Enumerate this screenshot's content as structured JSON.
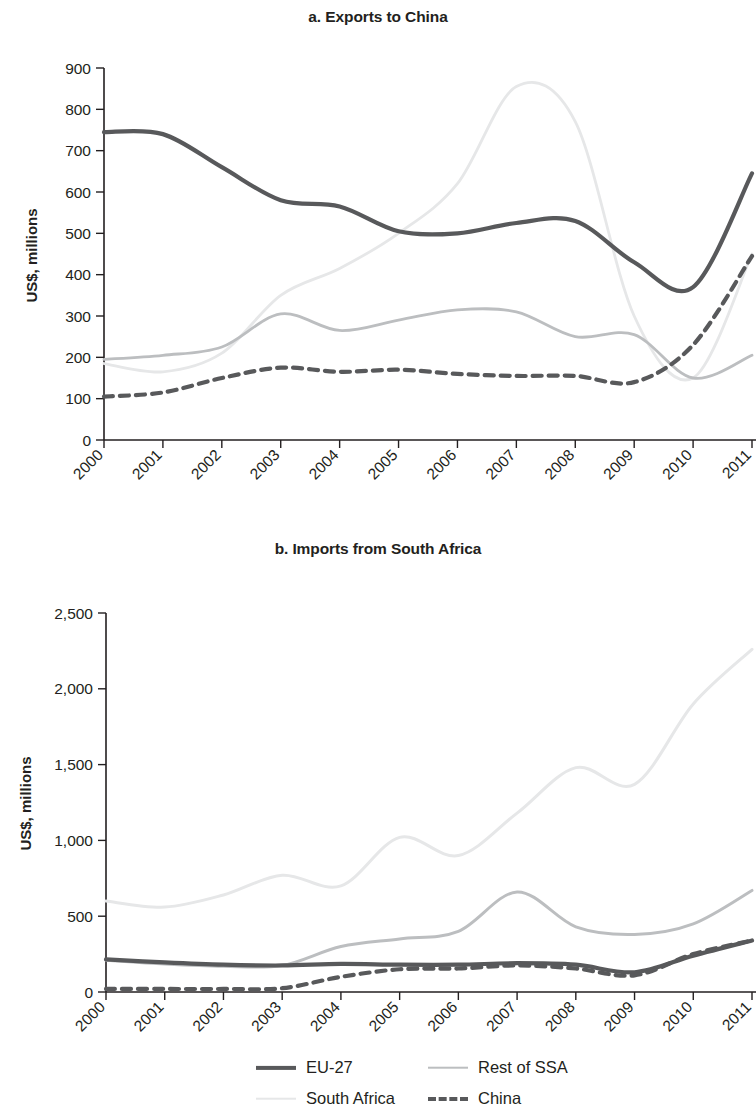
{
  "figure": {
    "panel_a_title": "a. Exports to China",
    "panel_b_title": "b. Imports from South Africa",
    "y_axis_title": "US$, millions"
  },
  "legend": {
    "position": "bottom",
    "items": [
      {
        "label": "EU-27",
        "color": "#58595b",
        "style": "solid",
        "width": 4.2,
        "swatch": "line-swatch-eu27"
      },
      {
        "label": "Rest of SSA",
        "color": "#bcbec0",
        "style": "solid",
        "width": 2.6,
        "swatch": "line-swatch-rest-of-ssa"
      },
      {
        "label": "South Africa",
        "color": "#e6e7e8",
        "style": "solid",
        "width": 2.6,
        "swatch": "line-swatch-south-africa"
      },
      {
        "label": "China",
        "color": "#58595b",
        "style": "dashed",
        "width": 4.2,
        "swatch": "line-swatch-china"
      }
    ]
  },
  "chart_data": [
    {
      "id": "panel-a",
      "type": "line",
      "title": "a. Exports to China",
      "xlabel": "",
      "ylabel": "US$, millions",
      "x": [
        2000,
        2001,
        2002,
        2003,
        2004,
        2005,
        2006,
        2007,
        2008,
        2009,
        2010,
        2011
      ],
      "xtick_labels": [
        "2000",
        "2001",
        "2002",
        "2003",
        "2004",
        "2005",
        "2006",
        "2007",
        "2008",
        "2009",
        "2010",
        "2011"
      ],
      "ytick_values": [
        0,
        100,
        200,
        300,
        400,
        500,
        600,
        700,
        800,
        900
      ],
      "ytick_labels": [
        "0",
        "100",
        "200",
        "300",
        "400",
        "500",
        "600",
        "700",
        "800",
        "900"
      ],
      "ylim": [
        0,
        900
      ],
      "grid": false,
      "series": [
        {
          "name": "EU-27",
          "color": "#58595b",
          "style": "solid",
          "width": 4.2,
          "values": [
            745,
            740,
            660,
            580,
            565,
            505,
            500,
            525,
            530,
            430,
            370,
            645
          ]
        },
        {
          "name": "Rest of SSA",
          "color": "#bcbec0",
          "style": "solid",
          "width": 2.8,
          "values": [
            195,
            205,
            225,
            305,
            265,
            290,
            315,
            310,
            250,
            255,
            150,
            205
          ]
        },
        {
          "name": "South Africa",
          "color": "#e6e7e8",
          "style": "solid",
          "width": 2.8,
          "values": [
            185,
            165,
            210,
            350,
            415,
            500,
            620,
            855,
            770,
            300,
            150,
            450
          ]
        },
        {
          "name": "China",
          "color": "#58595b",
          "style": "dashed",
          "width": 4.2,
          "values": [
            105,
            115,
            150,
            175,
            165,
            170,
            160,
            155,
            155,
            140,
            230,
            445
          ]
        }
      ]
    },
    {
      "id": "panel-b",
      "type": "line",
      "title": "b. Imports from South Africa",
      "xlabel": "",
      "ylabel": "US$, millions",
      "x": [
        2000,
        2001,
        2002,
        2003,
        2004,
        2005,
        2006,
        2007,
        2008,
        2009,
        2010,
        2011
      ],
      "xtick_labels": [
        "2000",
        "2001",
        "2002",
        "2003",
        "2004",
        "2005",
        "2006",
        "2007",
        "2008",
        "2009",
        "2010",
        "2011"
      ],
      "ytick_values": [
        0,
        500,
        1000,
        1500,
        2000,
        2500
      ],
      "ytick_labels": [
        "0",
        "500",
        "1,000",
        "1,500",
        "2,000",
        "2,500"
      ],
      "ylim": [
        0,
        2500
      ],
      "grid": false,
      "series": [
        {
          "name": "EU-27",
          "color": "#58595b",
          "style": "solid",
          "width": 4.2,
          "values": [
            215,
            195,
            180,
            175,
            185,
            180,
            180,
            190,
            180,
            130,
            240,
            340
          ]
        },
        {
          "name": "Rest of SSA",
          "color": "#bcbec0",
          "style": "solid",
          "width": 3.0,
          "values": [
            210,
            185,
            170,
            175,
            300,
            350,
            400,
            660,
            430,
            380,
            450,
            670
          ]
        },
        {
          "name": "South Africa",
          "color": "#e6e7e8",
          "style": "solid",
          "width": 3.0,
          "values": [
            600,
            560,
            640,
            770,
            700,
            1020,
            900,
            1180,
            1480,
            1370,
            1900,
            2260
          ]
        },
        {
          "name": "China",
          "color": "#58595b",
          "style": "dashed",
          "width": 4.2,
          "values": [
            20,
            20,
            20,
            25,
            100,
            150,
            155,
            175,
            155,
            110,
            250,
            340
          ]
        }
      ]
    }
  ]
}
